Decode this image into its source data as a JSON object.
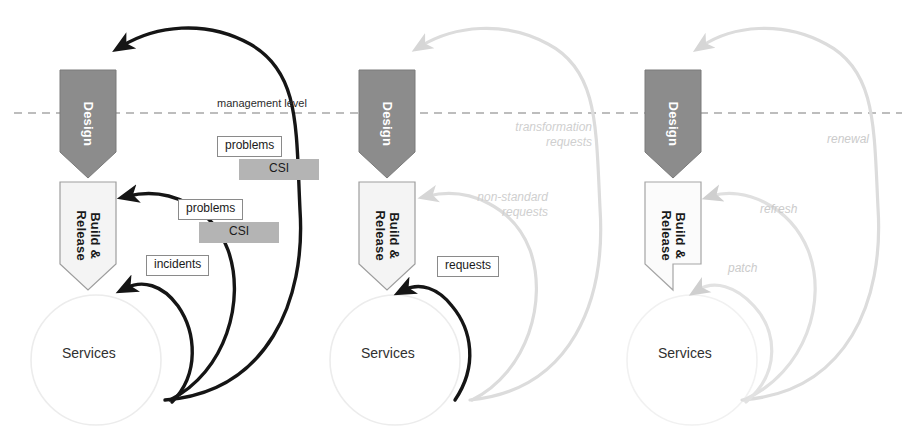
{
  "diagram": {
    "colors": {
      "design_fill": "#8c8c8c",
      "design_stroke": "#6e6e6e",
      "build_fill": "#f2f2f2",
      "build_stroke": "#9a9a9a",
      "services_circle_stroke": "#ebebeb",
      "dashed_line": "#a8a8a8",
      "dark_arrow": "#151515",
      "ghost_arrow": "#dcdcdc",
      "csi_fill": "#b4b4b4",
      "ghost_text": "#c6c6c6"
    },
    "management_level_label": "management level",
    "panels": [
      {
        "id": "operational",
        "design_label": "Design",
        "build_label_line1": "Build &",
        "build_label_line2": "Release",
        "services_label": "Services",
        "flow_labels": [
          {
            "text": "problems",
            "kind": "box"
          },
          {
            "text": "CSI",
            "kind": "csi"
          },
          {
            "text": "problems",
            "kind": "box"
          },
          {
            "text": "CSI",
            "kind": "csi"
          },
          {
            "text": "incidents",
            "kind": "box"
          }
        ]
      },
      {
        "id": "requests",
        "design_label": "Design",
        "build_label_line1": "Build &",
        "build_label_line2": "Release",
        "services_label": "Services",
        "flow_labels": [
          {
            "text": "transformation",
            "kind": "ghost",
            "text2": "requests"
          },
          {
            "text": "non-standard",
            "kind": "ghost",
            "text2": "requests"
          },
          {
            "text": "requests",
            "kind": "box"
          }
        ]
      },
      {
        "id": "renewal",
        "design_label": "Design",
        "build_label_line1": "Build &",
        "build_label_line2": "Release",
        "services_label": "Services",
        "flow_labels": [
          {
            "text": "renewal",
            "kind": "ghost"
          },
          {
            "text": "refresh",
            "kind": "ghost"
          },
          {
            "text": "patch",
            "kind": "ghost"
          }
        ]
      }
    ]
  }
}
